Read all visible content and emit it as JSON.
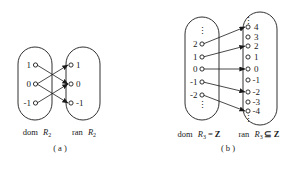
{
  "figure": {
    "background": "#ffffff",
    "ink": "#1a1a1a",
    "panels": [
      {
        "id": "a",
        "panel_label": "( a )",
        "domain_caption": {
          "prefix": "dom",
          "relation": "R",
          "subscript": "2",
          "suffix": ""
        },
        "range_caption": {
          "prefix": "ran",
          "relation": "R",
          "subscript": "2",
          "suffix": ""
        },
        "left_set": {
          "name": "dom-R2",
          "has_top_ellipsis": false,
          "has_bottom_ellipsis": false,
          "elements": [
            "1",
            "0",
            "-1"
          ]
        },
        "right_set": {
          "name": "ran-R2",
          "has_top_ellipsis": false,
          "has_bottom_ellipsis": false,
          "elements": [
            "1",
            "0",
            "-1"
          ]
        },
        "edges": [
          {
            "from": "1",
            "to": "0"
          },
          {
            "from": "0",
            "to": "1"
          },
          {
            "from": "0",
            "to": "-1"
          },
          {
            "from": "-1",
            "to": "0"
          }
        ]
      },
      {
        "id": "b",
        "panel_label": "( b )",
        "domain_caption": {
          "prefix": "dom",
          "relation": "R",
          "subscript": "3",
          "suffix": "= Z"
        },
        "range_caption": {
          "prefix": "ran",
          "relation": "R",
          "subscript": "3",
          "suffix": "⊆ Z"
        },
        "left_set": {
          "name": "dom-R3",
          "has_top_ellipsis": true,
          "has_bottom_ellipsis": true,
          "elements": [
            "2",
            "1",
            "0",
            "-1",
            "-2"
          ]
        },
        "right_set": {
          "name": "ran-R3",
          "has_top_ellipsis": true,
          "has_bottom_ellipsis": true,
          "elements": [
            "4",
            "3",
            "2",
            "1",
            "0",
            "-1",
            "-2",
            "-3",
            "-4"
          ]
        },
        "edges": [
          {
            "from": "2",
            "to": "4"
          },
          {
            "from": "1",
            "to": "2"
          },
          {
            "from": "0",
            "to": "0"
          },
          {
            "from": "-1",
            "to": "-2"
          },
          {
            "from": "-2",
            "to": "-4"
          }
        ]
      }
    ],
    "ellipsis_glyph": "⋮"
  }
}
